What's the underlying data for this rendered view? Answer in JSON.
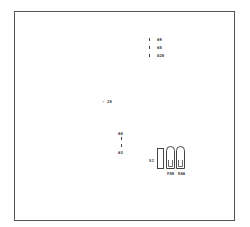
{
  "diagram": {
    "frame_color": "#555555",
    "legend": [
      {
        "marker": "tick",
        "label": "69"
      },
      {
        "marker": "tick",
        "label": "68"
      },
      {
        "marker": "tick",
        "label": "028"
      }
    ],
    "center_mark": {
      "marker": "-",
      "label": "28"
    },
    "vertical_scale": {
      "top_label": "60",
      "bottom_label": "63"
    },
    "component": {
      "side_label": "SJ",
      "pin_labels": [
        "FA9",
        "EA6"
      ]
    }
  }
}
